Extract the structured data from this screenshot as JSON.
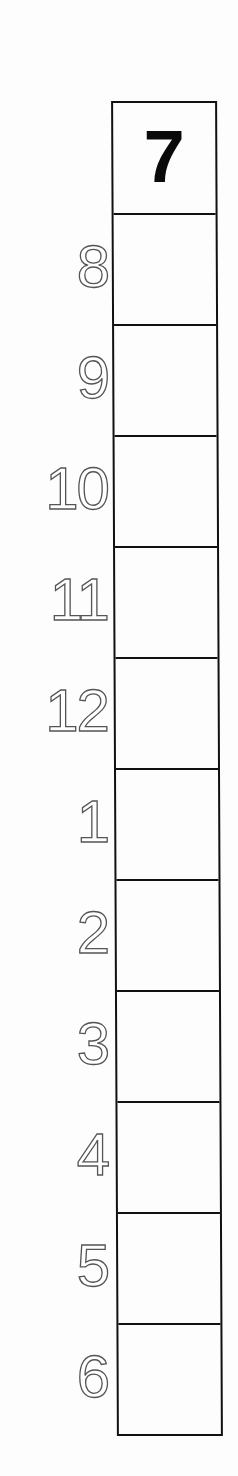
{
  "schedule": {
    "header": "7",
    "hours": [
      "8",
      "9",
      "10",
      "11",
      "12",
      "1",
      "2",
      "3",
      "4",
      "5",
      "6"
    ]
  }
}
